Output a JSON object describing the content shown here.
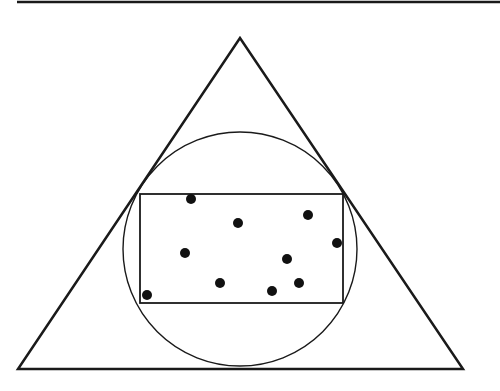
{
  "diagram": {
    "colors": {
      "stroke": "#1a1a1a",
      "background": "#ffffff",
      "dot": "#111111"
    },
    "top_rule": {
      "x1": 17,
      "y1": 2,
      "x2": 500,
      "y2": 2
    },
    "triangle": {
      "points": [
        [
          240,
          38
        ],
        [
          18,
          369
        ],
        [
          463,
          369
        ]
      ]
    },
    "circle": {
      "cx": 240,
      "cy": 249,
      "r": 117
    },
    "rectangle": {
      "x": 140,
      "y": 194,
      "width": 203,
      "height": 109
    },
    "dots": [
      {
        "x": 191,
        "y": 199
      },
      {
        "x": 238,
        "y": 223
      },
      {
        "x": 308,
        "y": 215
      },
      {
        "x": 337,
        "y": 243
      },
      {
        "x": 185,
        "y": 253
      },
      {
        "x": 287,
        "y": 259
      },
      {
        "x": 220,
        "y": 283
      },
      {
        "x": 299,
        "y": 283
      },
      {
        "x": 272,
        "y": 291
      },
      {
        "x": 147,
        "y": 295
      }
    ],
    "dot_radius": 5
  }
}
